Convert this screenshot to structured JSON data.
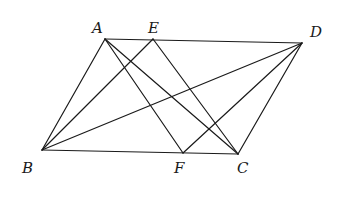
{
  "figure": {
    "type": "geometry",
    "points": {
      "A": {
        "x": 105,
        "y": 39
      },
      "E": {
        "x": 153,
        "y": 39
      },
      "D": {
        "x": 302,
        "y": 43
      },
      "B": {
        "x": 42,
        "y": 150
      },
      "F": {
        "x": 183,
        "y": 153
      },
      "C": {
        "x": 238,
        "y": 154
      }
    },
    "labels": [
      {
        "id": "A",
        "text": "A",
        "x": 92,
        "y": 33
      },
      {
        "id": "E",
        "text": "E",
        "x": 148,
        "y": 33
      },
      {
        "id": "D",
        "text": "D",
        "x": 310,
        "y": 37
      },
      {
        "id": "B",
        "text": "B",
        "x": 22,
        "y": 173
      },
      {
        "id": "F",
        "text": "F",
        "x": 174,
        "y": 173
      },
      {
        "id": "C",
        "text": "C",
        "x": 237,
        "y": 173
      }
    ],
    "segments": [
      [
        "A",
        "D"
      ],
      [
        "A",
        "B"
      ],
      [
        "B",
        "C"
      ],
      [
        "C",
        "D"
      ],
      [
        "A",
        "C"
      ],
      [
        "A",
        "F"
      ],
      [
        "B",
        "E"
      ],
      [
        "B",
        "D"
      ],
      [
        "E",
        "C"
      ],
      [
        "F",
        "D"
      ]
    ]
  }
}
